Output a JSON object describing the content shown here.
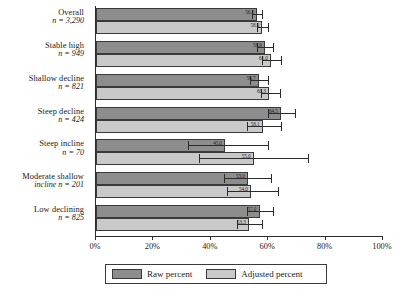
{
  "chart_data": {
    "type": "bar",
    "orientation": "horizontal",
    "title": "",
    "xlabel": "",
    "ylabel": "",
    "xlim": [
      0,
      100
    ],
    "xtick_labels": [
      "0%",
      "20%",
      "40%",
      "60%",
      "80%",
      "100%"
    ],
    "xtick_values": [
      0,
      20,
      40,
      60,
      80,
      100
    ],
    "grid": false,
    "legend_position": "bottom",
    "categories": [
      "Overall",
      "Stable high",
      "Shallow decline",
      "Steep decline",
      "Steep incline",
      "Moderate shallow incline",
      "Low declining"
    ],
    "category_labels": [
      {
        "name": "Overall",
        "n": "n = 3,290",
        "two_line": false
      },
      {
        "name": "Stable high",
        "n": "n = 949",
        "two_line": false
      },
      {
        "name": "Shallow decline",
        "n": "n = 821",
        "two_line": false
      },
      {
        "name": "Steep decline",
        "n": "n = 424",
        "two_line": false
      },
      {
        "name": "Steep incline",
        "n": "n = 70",
        "two_line": false
      },
      {
        "name": "Moderate shallow",
        "n": "incline n = 201",
        "two_line": true
      },
      {
        "name": "Low declining",
        "n": "n = 825",
        "two_line": false
      }
    ],
    "series": [
      {
        "name": "Raw percent",
        "color": "#8d8d8d",
        "values": [
          56.2,
          58.9,
          56.7,
          64.5,
          45.0,
          53.0,
          57.0
        ],
        "value_labels": [
          "56.2",
          "58.9",
          "56.7",
          "64.5",
          "45.0",
          "53.0",
          "57.0"
        ],
        "ci_low": [
          54.5,
          56.0,
          53.5,
          60.0,
          32.0,
          44.5,
          52.5
        ],
        "ci_high": [
          58.0,
          61.5,
          60.0,
          69.5,
          60.0,
          61.0,
          61.5
        ]
      },
      {
        "name": "Adjusted percent",
        "color": "#c9c9c9",
        "values": [
          58.0,
          61.0,
          60.3,
          58.1,
          55.0,
          54.0,
          53.3
        ],
        "value_labels": [
          "58.0",
          "61.0",
          "60.3",
          "58.1",
          "55.0",
          "54.0",
          "53.3"
        ],
        "ci_low": [
          56.0,
          58.0,
          57.5,
          52.5,
          36.0,
          45.5,
          49.0
        ],
        "ci_high": [
          60.0,
          64.5,
          64.0,
          64.5,
          74.0,
          63.5,
          58.0
        ]
      }
    ],
    "legend": [
      {
        "label": "Raw percent",
        "color": "#8d8d8d"
      },
      {
        "label": "Adjusted percent",
        "color": "#c9c9c9"
      }
    ]
  }
}
